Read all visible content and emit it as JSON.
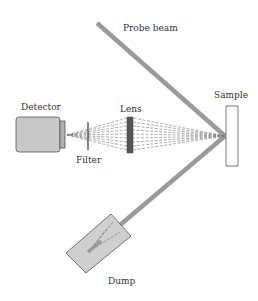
{
  "labels": {
    "probe_beam": "Probe beam",
    "sample": "Sample",
    "detector": "Detector",
    "lens": "Lens",
    "filter": "Filter",
    "dump": "Dump"
  },
  "colors": {
    "beam": "#9a9a9a",
    "detector_body": "#c8c8c8",
    "detector_window": "#b0b0b0",
    "lens": "#555555",
    "sample_fill": "#ffffff",
    "dump_fill": "#cfcfcf",
    "outline": "#555555",
    "rays": "#777777",
    "text": "#333333"
  },
  "components": [
    {
      "id": "probe-beam",
      "type": "beam"
    },
    {
      "id": "sample",
      "type": "target"
    },
    {
      "id": "lens",
      "type": "optic"
    },
    {
      "id": "filter",
      "type": "optic"
    },
    {
      "id": "detector",
      "type": "sensor"
    },
    {
      "id": "dump",
      "type": "beam-dump"
    }
  ]
}
